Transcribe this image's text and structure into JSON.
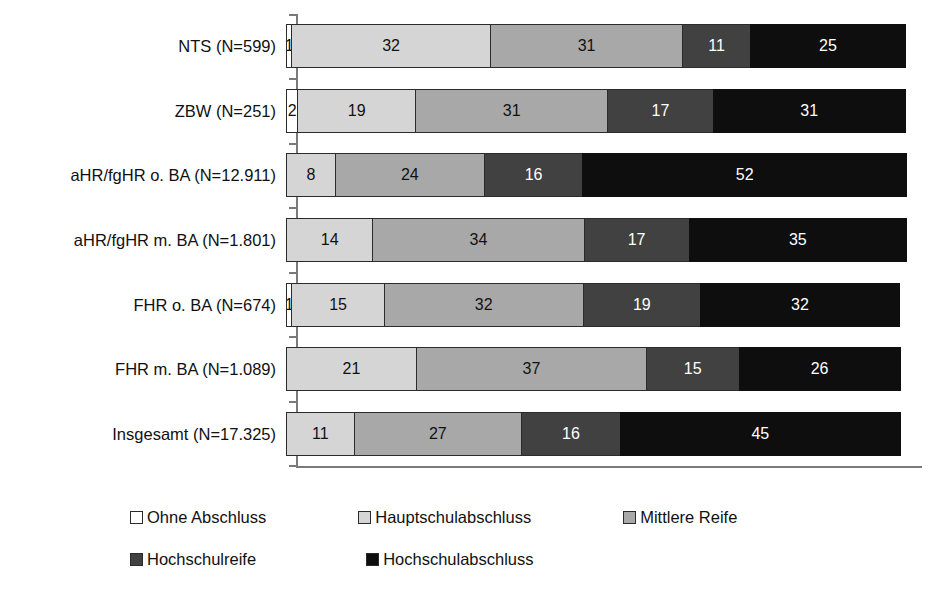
{
  "chart_data": {
    "type": "bar",
    "orientation": "horizontal",
    "stacked": true,
    "normalized_percent": true,
    "title": "",
    "xlabel": "",
    "ylabel": "",
    "xlim": [
      0,
      100
    ],
    "grid": false,
    "legend_position": "bottom",
    "categories": [
      "NTS  (N=599)",
      "ZBW (N=251)",
      "aHR/fgHR o. BA (N=12.911)",
      "aHR/fgHR m. BA (N=1.801)",
      "FHR o. BA (N=674)",
      "FHR m. BA (N=1.089)",
      "Insgesamt (N=17.325)"
    ],
    "series": [
      {
        "name": "Ohne Abschluss",
        "color": "#ffffff",
        "values": [
          1,
          2,
          0,
          0,
          1,
          0,
          0
        ]
      },
      {
        "name": "Hauptschulabschluss",
        "color": "#d5d5d5",
        "values": [
          32,
          19,
          8,
          14,
          15,
          21,
          11
        ]
      },
      {
        "name": "Mittlere Reife",
        "color": "#a8a8a8",
        "values": [
          31,
          31,
          24,
          34,
          32,
          37,
          27
        ]
      },
      {
        "name": "Hochschulreife",
        "color": "#414141",
        "values": [
          11,
          17,
          16,
          17,
          19,
          15,
          16
        ]
      },
      {
        "name": "Hochschulabschluss",
        "color": "#0e0e0e",
        "values": [
          25,
          31,
          52,
          35,
          32,
          26,
          45
        ]
      }
    ],
    "bar_labels": [
      [
        "1",
        "32",
        "31",
        "11",
        "25"
      ],
      [
        "2",
        "19",
        "31",
        "17",
        "31"
      ],
      [
        "",
        "8",
        "24",
        "16",
        "52"
      ],
      [
        "",
        "14",
        "34",
        "17",
        "35"
      ],
      [
        "1",
        "15",
        "32",
        "19",
        "32"
      ],
      [
        "",
        "21",
        "37",
        "15",
        "26"
      ],
      [
        "",
        "11",
        "27",
        "16",
        "45"
      ]
    ]
  },
  "legend": {
    "items": [
      {
        "label": "Ohne Abschluss",
        "color": "#ffffff"
      },
      {
        "label": "Hauptschulabschluss",
        "color": "#d5d5d5"
      },
      {
        "label": "Mittlere Reife",
        "color": "#a8a8a8"
      },
      {
        "label": "Hochschulreife",
        "color": "#414141"
      },
      {
        "label": "Hochschulabschluss",
        "color": "#0e0e0e"
      }
    ]
  }
}
